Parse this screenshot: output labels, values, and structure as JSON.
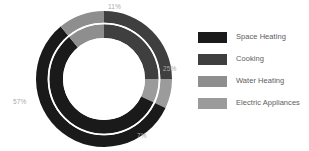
{
  "chart_data": {
    "type": "pie",
    "variant": "donut",
    "title": "",
    "subtitle": "",
    "xlabel": "",
    "ylabel": "",
    "grid": false,
    "legend_position": "right",
    "categories": [
      "Space Heating",
      "Cooking",
      "Water Heating",
      "Electric Appliances"
    ],
    "values": [
      57,
      25,
      11,
      7
    ],
    "unit": "%",
    "data_labels": [
      "57%",
      "25%",
      "11%",
      "7%"
    ],
    "colors": [
      "#1a1a1a",
      "#3f3f3f",
      "#8e8e8e",
      "#9b9b9b"
    ],
    "slices": [
      {
        "label": "Space Heating",
        "value": 57,
        "display": "57%",
        "color": "#1a1a1a"
      },
      {
        "label": "Cooking",
        "value": 25,
        "display": "25%",
        "color": "#3f3f3f"
      },
      {
        "label": "Water Heating",
        "value": 11,
        "display": "11%",
        "color": "#8e8e8e"
      },
      {
        "label": "Electric Appliances",
        "value": 7,
        "display": "7%",
        "color": "#9b9b9b"
      }
    ]
  },
  "donut": {
    "labels": {
      "top": "11%",
      "right": "25%",
      "bottom": "7%",
      "left": "57%"
    },
    "label_color": "#a8a8a8",
    "divider_color": "#ffffff",
    "center_color": "#ffffff"
  },
  "legend": {
    "items": [
      {
        "label": "Space Heating",
        "color": "#1a1a1a"
      },
      {
        "label": "Cooking",
        "color": "#3f3f3f"
      },
      {
        "label": "Water Heating",
        "color": "#8e8e8e"
      },
      {
        "label": "Electric Appliances",
        "color": "#9b9b9b"
      }
    ],
    "text_color": "#5c5c5c"
  },
  "canvas": {
    "background": "#ffffff",
    "width": 309,
    "height": 151
  }
}
